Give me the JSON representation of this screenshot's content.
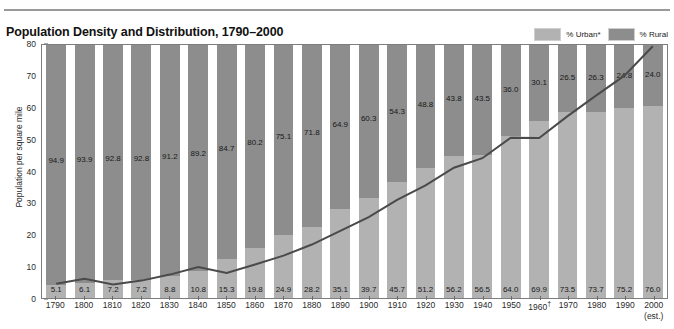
{
  "header": {
    "cutoff_text": "",
    "title": "Population Density and Distribution, 1790–2000"
  },
  "legend": {
    "urban_label": "% Urban*",
    "rural_label": "% Rural",
    "urban_color": "#b2b2b2",
    "rural_color": "#8d8d8d"
  },
  "axis": {
    "ylabel": "Population per square mile",
    "yticks": [
      "0",
      "10",
      "20",
      "30",
      "40",
      "50",
      "60",
      "70",
      "80"
    ],
    "ymin": 0,
    "ymax": 80,
    "note_1960": "†",
    "note_2000": "(est.)"
  },
  "chart_data": {
    "type": "bar",
    "title": "Population Density and Distribution, 1790–2000",
    "xlabel": "",
    "ylabel": "Population per square mile",
    "ylim": [
      0,
      80
    ],
    "grid": false,
    "legend_position": "top-right",
    "categories": [
      "1790",
      "1800",
      "1810",
      "1820",
      "1830",
      "1840",
      "1850",
      "1860",
      "1870",
      "1880",
      "1890",
      "1900",
      "1910",
      "1920",
      "1930",
      "1940",
      "1950",
      "1960",
      "1970",
      "1980",
      "1990",
      "2000"
    ],
    "series": [
      {
        "name": "% Urban*",
        "type": "bar-stacked",
        "color": "#b2b2b2",
        "values": [
          5.1,
          6.1,
          7.2,
          7.2,
          8.8,
          10.8,
          15.3,
          19.8,
          24.9,
          28.2,
          35.1,
          39.7,
          45.7,
          51.2,
          56.2,
          56.5,
          64.0,
          69.9,
          73.5,
          73.7,
          75.2,
          76.0
        ]
      },
      {
        "name": "% Rural",
        "type": "bar-stacked",
        "color": "#8d8d8d",
        "values": [
          94.9,
          93.9,
          92.8,
          92.8,
          91.2,
          89.2,
          84.7,
          80.2,
          75.1,
          71.8,
          64.9,
          60.3,
          54.3,
          48.8,
          43.8,
          43.5,
          36.0,
          30.1,
          26.5,
          26.3,
          24.8,
          24.0
        ]
      },
      {
        "name": "Population per square mile",
        "type": "line",
        "color": "#4a4a4a",
        "values": [
          4.5,
          6.1,
          4.3,
          5.5,
          7.4,
          9.8,
          7.9,
          10.6,
          13.4,
          16.9,
          21.2,
          25.6,
          31.0,
          35.6,
          41.2,
          44.2,
          50.7,
          50.6,
          57.5,
          64.0,
          70.3,
          79.6
        ]
      }
    ]
  }
}
